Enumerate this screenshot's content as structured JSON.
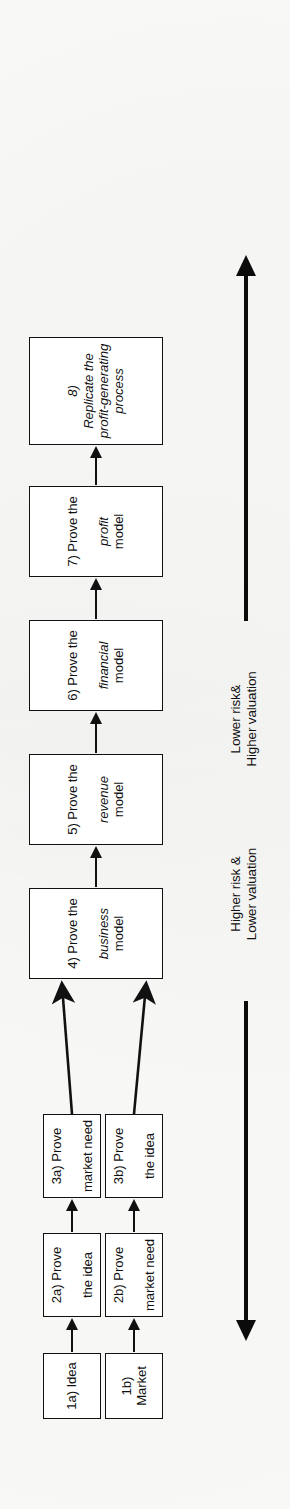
{
  "diagram": {
    "orientation": "rotated-90",
    "colors": {
      "stroke": "#111111",
      "fill": "#ffffff",
      "background": "#fdfdfc"
    },
    "nodes": [
      {
        "id": "1a",
        "label_prefix": "1a) Idea",
        "label_em": "",
        "label_suffix": "",
        "lane": "a"
      },
      {
        "id": "1b",
        "label_prefix": "1b) Market",
        "label_em": "",
        "label_suffix": "",
        "lane": "b"
      },
      {
        "id": "2a",
        "label_prefix": "2a) Prove",
        "label_em": "",
        "label_suffix": "the idea",
        "lane": "a"
      },
      {
        "id": "2b",
        "label_prefix": "2b) Prove",
        "label_em": "",
        "label_suffix": "market need",
        "lane": "b"
      },
      {
        "id": "3a",
        "label_prefix": "3a) Prove",
        "label_em": "",
        "label_suffix": "market need",
        "lane": "a"
      },
      {
        "id": "3b",
        "label_prefix": "3b) Prove",
        "label_em": "",
        "label_suffix": "the idea",
        "lane": "b"
      },
      {
        "id": "4",
        "label_prefix": "4) Prove the",
        "label_em": "business",
        "label_suffix": "model",
        "lane": "main"
      },
      {
        "id": "5",
        "label_prefix": "5) Prove the",
        "label_em": "revenue",
        "label_suffix": "model",
        "lane": "main"
      },
      {
        "id": "6",
        "label_prefix": "6) Prove the",
        "label_em": "financial",
        "label_suffix": "model",
        "lane": "main"
      },
      {
        "id": "7",
        "label_prefix": "7) Prove the",
        "label_em": "profit",
        "label_suffix": "model",
        "lane": "main"
      },
      {
        "id": "8",
        "label_prefix": "8) ",
        "label_em": "Replicate",
        "label_suffix": "the profit-generating process",
        "lane": "main"
      }
    ],
    "edges": [
      {
        "from": "1a",
        "to": "2a",
        "style": "straight"
      },
      {
        "from": "2a",
        "to": "3a",
        "style": "straight"
      },
      {
        "from": "1b",
        "to": "2b",
        "style": "straight"
      },
      {
        "from": "2b",
        "to": "3b",
        "style": "straight"
      },
      {
        "from": "3a",
        "to": "4",
        "style": "diagonal"
      },
      {
        "from": "3b",
        "to": "4",
        "style": "diagonal"
      },
      {
        "from": "4",
        "to": "5",
        "style": "straight"
      },
      {
        "from": "5",
        "to": "6",
        "style": "straight"
      },
      {
        "from": "6",
        "to": "7",
        "style": "straight"
      },
      {
        "from": "7",
        "to": "8",
        "style": "straight"
      }
    ],
    "axis": {
      "early": {
        "line1": "Higher risk &",
        "line2": "Lower valuation",
        "arrow": "down"
      },
      "late": {
        "line1": "Lower risk&",
        "line2": "Higher valuation",
        "arrow": "up"
      }
    }
  }
}
